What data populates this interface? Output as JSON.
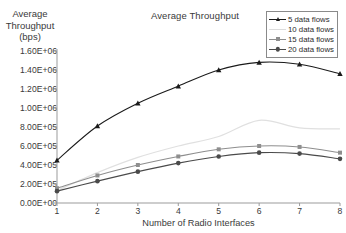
{
  "chart_data": {
    "type": "line",
    "title": "Average Throughput",
    "xlabel": "Number of Radio Interfaces",
    "ylabel": "Average Throughput (bps)",
    "ylabel_lines": [
      "Average",
      "Throughput",
      "(bps)"
    ],
    "grid": false,
    "legend_position": "top-right",
    "x": [
      1,
      2,
      3,
      4,
      5,
      6,
      7,
      8
    ],
    "xlim": [
      1,
      8
    ],
    "ylim": [
      0,
      1600000
    ],
    "ytick_labels": [
      "1.60E+06",
      "1.40E+06",
      "1.20E+06",
      "1.00E+06",
      "8.00E+05",
      "6.00E+05",
      "4.00E+05",
      "2.00E+05",
      "0.00E+00"
    ],
    "ytick_values": [
      1600000,
      1400000,
      1200000,
      1000000,
      800000,
      600000,
      400000,
      200000,
      0
    ],
    "xtick_labels": [
      "1",
      "2",
      "3",
      "4",
      "5",
      "6",
      "7",
      "8"
    ],
    "series": [
      {
        "name": "5 data flows",
        "color": "#1a1a1a",
        "marker": "triangle",
        "values": [
          450000,
          810000,
          1050000,
          1230000,
          1400000,
          1480000,
          1460000,
          1360000
        ]
      },
      {
        "name": "10 data flows",
        "color": "#e0e0e0",
        "marker": "none",
        "values": [
          130000,
          320000,
          480000,
          600000,
          700000,
          870000,
          790000,
          780000
        ]
      },
      {
        "name": "15 data flows",
        "color": "#8e8e8e",
        "marker": "square",
        "values": [
          155000,
          290000,
          400000,
          490000,
          565000,
          600000,
          590000,
          530000
        ]
      },
      {
        "name": "20 data flows",
        "color": "#4a4a4a",
        "marker": "circle",
        "values": [
          125000,
          230000,
          330000,
          420000,
          490000,
          530000,
          520000,
          465000
        ]
      }
    ]
  }
}
